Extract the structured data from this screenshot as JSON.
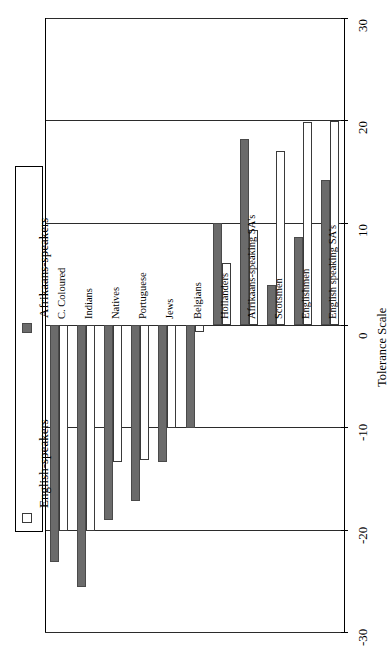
{
  "chart_data": {
    "type": "bar",
    "orientation": "horizontal-rotated",
    "title": "",
    "xlabel": "",
    "ylabel": "Tolerance Scale",
    "axis_title": "Tolerance Scale",
    "ylim": [
      -30,
      30
    ],
    "tick_values": [
      30,
      20,
      10,
      0,
      -10,
      -20,
      -30
    ],
    "tick_labels": [
      "30",
      "20",
      "10",
      "0",
      "-10",
      "-20",
      "-30"
    ],
    "grid": true,
    "legend_position": "left",
    "categories": [
      "C. Coloured",
      "Indians",
      "Natives",
      "Portuguese",
      "Jews",
      "Belgians",
      "Hollanders",
      "Afrikaans-speaking SA's",
      "Scotsmen",
      "Englishmen",
      "English speaking SA's"
    ],
    "series": [
      {
        "name": "Afrikaans-speakers",
        "color": "#6b6b6b",
        "values": [
          -23.2,
          -25.6,
          -19.1,
          -17.2,
          -13.4,
          -10.1,
          10.0,
          18.2,
          3.9,
          8.6,
          14.2
        ]
      },
      {
        "name": "English-speakers",
        "color": "#ffffff",
        "values": [
          -20.1,
          -20.1,
          -13.4,
          -13.2,
          -10.1,
          -0.7,
          6.1,
          9.3,
          17.0,
          19.8,
          19.9
        ]
      }
    ]
  },
  "legend": {
    "entries": [
      {
        "label": "English-speakers",
        "marker": "open-square-swatch"
      },
      {
        "label": "Afrikaans-speakers",
        "marker": "filled-square-swatch"
      }
    ]
  }
}
